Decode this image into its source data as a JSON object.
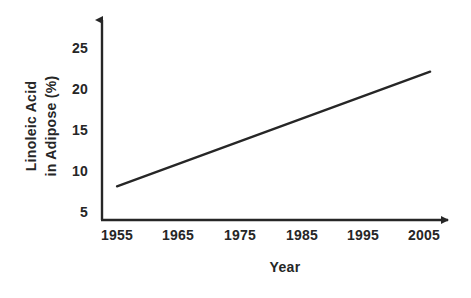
{
  "chart_data": {
    "type": "line",
    "title": "",
    "subtitle": "",
    "xlabel": "Year",
    "ylabel": "Linoleic Acid in Adipose (%)",
    "ylabel_lines": [
      "Linoleic Acid",
      "in Adipose (%)"
    ],
    "x": [
      1955,
      2006
    ],
    "values": [
      8,
      22
    ],
    "series": [
      {
        "name": "Linoleic Acid in Adipose",
        "x": [
          1955,
          2006
        ],
        "values": [
          8,
          22
        ]
      }
    ],
    "xticks": [
      1955,
      1965,
      1975,
      1985,
      1995,
      2005
    ],
    "xtick_labels": [
      "1955",
      "1965",
      "1975",
      "1985",
      "1995",
      "2005"
    ],
    "yticks": [
      5,
      10,
      15,
      20,
      25
    ],
    "ytick_labels": [
      "5",
      "10",
      "15",
      "20",
      "25"
    ],
    "xlim": [
      1952,
      2010
    ],
    "ylim": [
      4,
      27.5
    ],
    "grid": false,
    "legend": false,
    "legend_position": "none",
    "line_color": "#262626",
    "axis_color": "#262626",
    "background_color": "#ffffff",
    "annotations": []
  },
  "axes": {
    "y_arrow": "up-arrow-icon",
    "x_arrow": "right-arrow-icon"
  }
}
